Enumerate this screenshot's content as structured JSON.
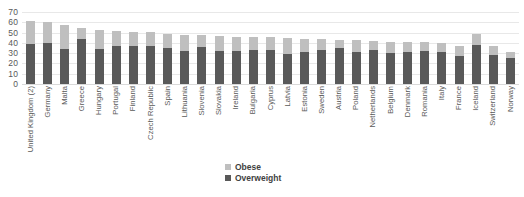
{
  "chart_data": {
    "type": "bar",
    "stacked": true,
    "title": "",
    "subtitle": "",
    "xlabel": "",
    "ylabel": "",
    "ylim": [
      0,
      70
    ],
    "ytick_step": 10,
    "yticks": [
      "70",
      "60",
      "50",
      "40",
      "30",
      "20",
      "10",
      "0"
    ],
    "grid": true,
    "legend_position": "bottom-center",
    "categories": [
      "United Kingdom (2)",
      "Germany",
      "Malta",
      "Greece",
      "Hungary",
      "Portugal",
      "Finland",
      "Czech Republic",
      "Spain",
      "Lithuania",
      "Slovenia",
      "Slovakia",
      "Ireland",
      "Bulgaria",
      "Cyprus",
      "Latvia",
      "Estonia",
      "Sweden",
      "Austria",
      "Poland",
      "Netherlands",
      "Belgium",
      "Denmark",
      "Romania",
      "Italy",
      "France",
      "Iceland",
      "Switzerland",
      "Norway"
    ],
    "series": [
      {
        "name": "Overweight",
        "color": "#595959",
        "values": [
          38.5,
          39.5,
          34.5,
          43.5,
          34.0,
          37.0,
          36.5,
          36.5,
          35.5,
          32.5,
          36.0,
          32.0,
          32.5,
          33.5,
          33.5,
          29.5,
          31.0,
          33.5,
          35.0,
          31.5,
          33.0,
          30.5,
          31.5,
          32.5,
          31.0,
          27.0,
          38.0,
          28.5,
          25.0
        ]
      },
      {
        "name": "Obese",
        "color": "#bfbfbf",
        "values": [
          22.5,
          20.5,
          23.0,
          10.5,
          18.5,
          14.5,
          14.5,
          14.0,
          13.0,
          15.5,
          12.0,
          14.5,
          13.5,
          12.5,
          12.5,
          15.5,
          12.5,
          10.0,
          8.0,
          11.5,
          9.0,
          10.5,
          9.5,
          8.5,
          8.5,
          10.0,
          11.0,
          8.0,
          6.0
        ]
      }
    ],
    "totals": [
      61.0,
      60.0,
      57.5,
      54.0,
      52.5,
      51.5,
      51.0,
      50.5,
      48.5,
      48.0,
      48.0,
      46.5,
      46.0,
      46.0,
      46.0,
      45.0,
      43.5,
      43.5,
      43.0,
      43.0,
      42.0,
      41.0,
      41.0,
      41.0,
      39.5,
      37.0,
      49.0,
      36.5,
      31.0
    ]
  },
  "legend": {
    "items": [
      {
        "label": "Obese",
        "color": "#bfbfbf"
      },
      {
        "label": "Overweight",
        "color": "#595959"
      }
    ]
  },
  "colors": {
    "obese": "#bfbfbf",
    "overweight": "#595959",
    "gridline": "#e8e8e8",
    "axis_text": "#595959",
    "background": "#ffffff"
  }
}
